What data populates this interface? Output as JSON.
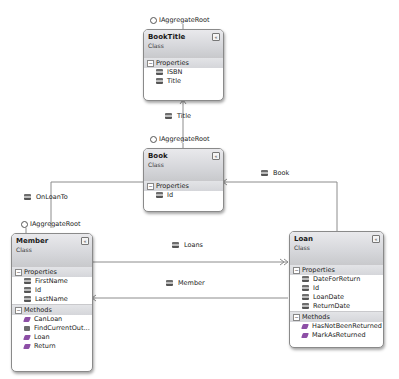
{
  "diagram": {
    "type": "class-diagram",
    "classes": {
      "booktitle": {
        "name": "BookTitle",
        "kind": "Class",
        "interface": "IAggregateRoot",
        "properties_header": "Properties",
        "properties": [
          "ISBN",
          "Title"
        ]
      },
      "book": {
        "name": "Book",
        "kind": "Class",
        "interface": "IAggregateRoot",
        "properties_header": "Properties",
        "properties": [
          "Id"
        ]
      },
      "member": {
        "name": "Member",
        "kind": "Class",
        "interface": "IAggregateRoot",
        "properties_header": "Properties",
        "properties": [
          "FirstName",
          "Id",
          "LastName"
        ],
        "methods_header": "Methods",
        "methods": [
          "CanLoan",
          "FindCurrentOut...",
          "Loan",
          "Return"
        ]
      },
      "loan": {
        "name": "Loan",
        "kind": "Class",
        "properties_header": "Properties",
        "properties": [
          "DateForReturn",
          "Id",
          "LoanDate",
          "ReturnDate"
        ],
        "methods_header": "Methods",
        "methods": [
          "HasNotBeenReturned",
          "MarkAsReturned"
        ]
      }
    },
    "associations": [
      {
        "from": "Book",
        "to": "BookTitle",
        "label": "Title"
      },
      {
        "from": "Member",
        "to": "Book",
        "label": "OnLoanTo"
      },
      {
        "from": "Loan",
        "to": "Book",
        "label": "Book"
      },
      {
        "from": "Member",
        "to": "Loan",
        "label": "Loans",
        "multiplicity": "collection"
      },
      {
        "from": "Loan",
        "to": "Member",
        "label": "Member"
      }
    ],
    "collapse_glyph": "«"
  }
}
